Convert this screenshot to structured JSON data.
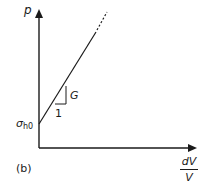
{
  "diagram": {
    "panel_label": "(b)",
    "y_axis_label": "p",
    "x_axis_label": {
      "numerator": "dV",
      "denominator": "V"
    },
    "intercept_label": {
      "symbol": "σ",
      "subscript": "h0"
    },
    "slope_label": "G",
    "run_label": "1",
    "line_color": "#1a1a1a"
  }
}
